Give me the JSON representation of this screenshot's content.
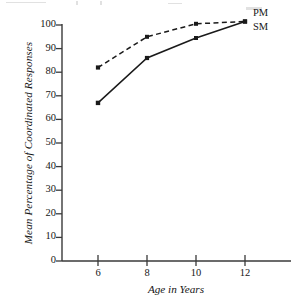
{
  "chart_data": {
    "type": "line",
    "title": "",
    "xlabel": "Age in Years",
    "ylabel": "Mean Percentage of Coordinated Responses",
    "x": [
      6,
      8,
      10,
      12
    ],
    "xticks": [
      "6",
      "8",
      "10",
      "12"
    ],
    "yticks": [
      "0",
      "10",
      "20",
      "30",
      "40",
      "50",
      "60",
      "70",
      "80",
      "90",
      "100"
    ],
    "ylim": [
      0,
      100
    ],
    "xlim": [
      4.6,
      13.8
    ],
    "grid": false,
    "legend_position": "top-right",
    "series": [
      {
        "name": "PM",
        "style": "dashed",
        "marker": "filled-square",
        "color": "#1a1a1a",
        "values": [
          82,
          95,
          100.5,
          101.5
        ]
      },
      {
        "name": "SM",
        "style": "solid",
        "marker": "filled-square",
        "color": "#1a1a1a",
        "values": [
          67,
          86,
          94.5,
          101.5
        ]
      }
    ]
  },
  "axes": {
    "y_title": "Mean Percentage of Coordinated Responses",
    "x_title": "Age in Years"
  },
  "legend": {
    "pm_label": "PM",
    "sm_label": "SM"
  },
  "yticks": {
    "t0": "0",
    "t10": "10",
    "t20": "20",
    "t30": "30",
    "t40": "40",
    "t50": "50",
    "t60": "60",
    "t70": "70",
    "t80": "80",
    "t90": "90",
    "t100": "100"
  },
  "xticks": {
    "t6": "6",
    "t8": "8",
    "t10": "10",
    "t12": "12"
  },
  "colors": {
    "axis": "#3a3a3a",
    "line": "#1a1a1a",
    "text": "#161616",
    "background": "#ffffff"
  }
}
